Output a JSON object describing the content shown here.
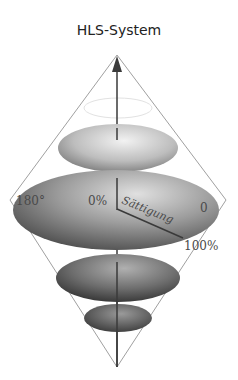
{
  "title": "HLS-System",
  "labels": {
    "hue_left": "180°",
    "center_saturation": "0%",
    "saturation_axis": "Sättigung",
    "hue_right": "0",
    "saturation_max": "100%"
  },
  "colors": {
    "background": "#ffffff",
    "cone_lines": "#9a9a9a",
    "axis": "#3a3a3a",
    "ellipse_dark": "#3e3e3e",
    "ellipse_light": "#d8d8d8"
  }
}
